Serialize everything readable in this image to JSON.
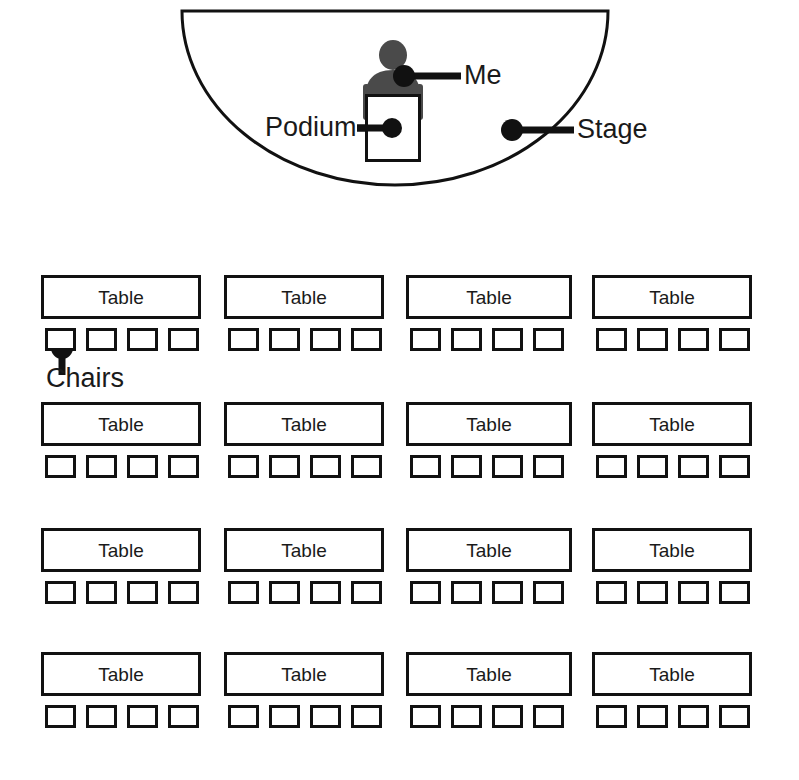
{
  "diagram": {
    "stage": {
      "label": "Stage",
      "shape": "half-ellipse",
      "outline_color": "#111111"
    },
    "podium": {
      "label": "Podium",
      "fill_color": "#ffffff",
      "outline_color": "#111111"
    },
    "person": {
      "label": "Me",
      "fill_color": "#4a4a4a"
    },
    "chairs_callout": {
      "label": "Chairs"
    },
    "seating": {
      "rows": 4,
      "columns": 4,
      "tables_total": 16,
      "chairs_per_table": 4,
      "chairs_total": 64,
      "table_label": "Table",
      "grid": [
        {
          "row": 1,
          "tables": [
            {
              "label": "Table",
              "left": 41,
              "width": 160,
              "chairs": [
                "chair",
                "chair",
                "chair",
                "chair"
              ]
            },
            {
              "label": "Table",
              "left": 224,
              "width": 160,
              "chairs": [
                "chair",
                "chair",
                "chair",
                "chair"
              ]
            },
            {
              "label": "Table",
              "left": 406,
              "width": 166,
              "chairs": [
                "chair",
                "chair",
                "chair",
                "chair"
              ]
            },
            {
              "label": "Table",
              "left": 592,
              "width": 160,
              "chairs": [
                "chair",
                "chair",
                "chair",
                "chair"
              ]
            }
          ]
        },
        {
          "row": 2,
          "tables": [
            {
              "label": "Table",
              "left": 41,
              "width": 160,
              "chairs": [
                "chair",
                "chair",
                "chair",
                "chair"
              ]
            },
            {
              "label": "Table",
              "left": 224,
              "width": 160,
              "chairs": [
                "chair",
                "chair",
                "chair",
                "chair"
              ]
            },
            {
              "label": "Table",
              "left": 406,
              "width": 166,
              "chairs": [
                "chair",
                "chair",
                "chair",
                "chair"
              ]
            },
            {
              "label": "Table",
              "left": 592,
              "width": 160,
              "chairs": [
                "chair",
                "chair",
                "chair",
                "chair"
              ]
            }
          ]
        },
        {
          "row": 3,
          "tables": [
            {
              "label": "Table",
              "left": 41,
              "width": 160,
              "chairs": [
                "chair",
                "chair",
                "chair",
                "chair"
              ]
            },
            {
              "label": "Table",
              "left": 224,
              "width": 160,
              "chairs": [
                "chair",
                "chair",
                "chair",
                "chair"
              ]
            },
            {
              "label": "Table",
              "left": 406,
              "width": 166,
              "chairs": [
                "chair",
                "chair",
                "chair",
                "chair"
              ]
            },
            {
              "label": "Table",
              "left": 592,
              "width": 160,
              "chairs": [
                "chair",
                "chair",
                "chair",
                "chair"
              ]
            }
          ]
        },
        {
          "row": 4,
          "tables": [
            {
              "label": "Table",
              "left": 41,
              "width": 160,
              "chairs": [
                "chair",
                "chair",
                "chair",
                "chair"
              ]
            },
            {
              "label": "Table",
              "left": 224,
              "width": 160,
              "chairs": [
                "chair",
                "chair",
                "chair",
                "chair"
              ]
            },
            {
              "label": "Table",
              "left": 406,
              "width": 166,
              "chairs": [
                "chair",
                "chair",
                "chair",
                "chair"
              ]
            },
            {
              "label": "Table",
              "left": 592,
              "width": 160,
              "chairs": [
                "chair",
                "chair",
                "chair",
                "chair"
              ]
            }
          ]
        }
      ]
    }
  }
}
